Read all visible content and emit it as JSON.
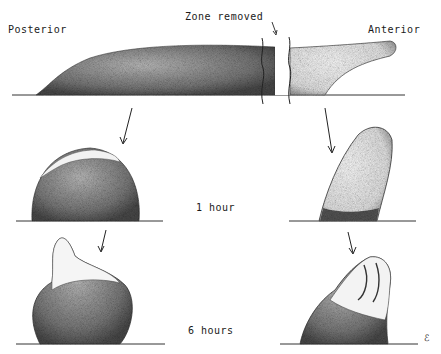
{
  "labels": {
    "posterior": "Posterior",
    "anterior": "Anterior",
    "zone_removed": "Zone removed",
    "time_1": "1 hour",
    "time_2": "6 hours",
    "signature": "ℰ"
  },
  "colors": {
    "ink": "#1a1a1a",
    "stipple_dark": "#6a6a6a",
    "stipple_light": "#d8d8d8",
    "background": "#ffffff"
  }
}
